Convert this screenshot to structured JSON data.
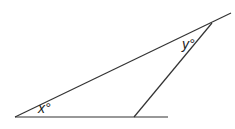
{
  "diagram": {
    "type": "geometry-triangle",
    "labels": {
      "x_angle": "x°",
      "y_angle": "y°"
    },
    "stroke_color": "#333333",
    "lines": [
      {
        "name": "base-line",
        "x1": 15,
        "y1": 117,
        "x2": 168,
        "y2": 117
      },
      {
        "name": "long-line",
        "x1": 15,
        "y1": 117,
        "x2": 231,
        "y2": 13
      },
      {
        "name": "third-side",
        "x1": 134,
        "y1": 117,
        "x2": 212,
        "y2": 23
      }
    ]
  }
}
